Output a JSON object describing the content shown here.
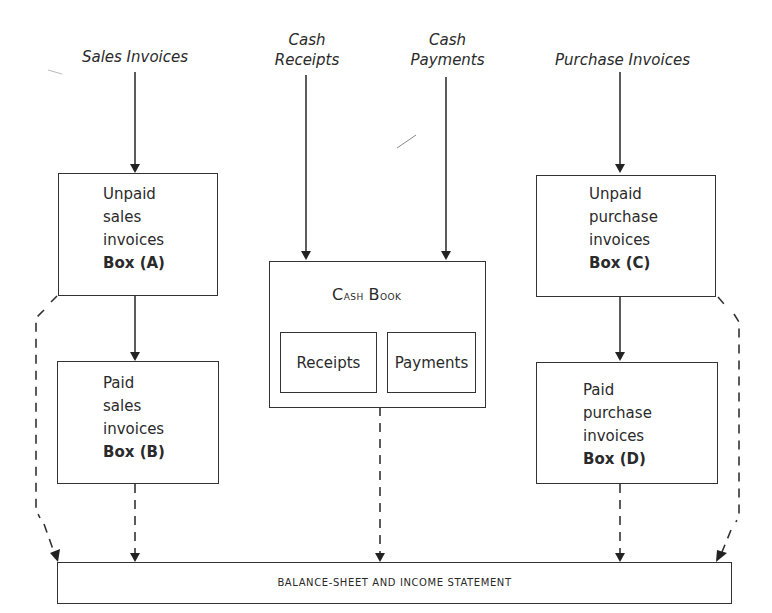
{
  "diagram": {
    "sources": [
      {
        "id": "sales-invoices",
        "label": "Sales Invoices"
      },
      {
        "id": "cash-receipts",
        "label_line1": "Cash",
        "label_line2": "Receipts"
      },
      {
        "id": "cash-payments",
        "label_line1": "Cash",
        "label_line2": "Payments"
      },
      {
        "id": "purchase-invoices",
        "label": "Purchase Invoices"
      }
    ],
    "boxes": {
      "a": {
        "lines": [
          "Unpaid",
          "sales",
          "invoices"
        ],
        "tag": "Box (A)"
      },
      "b": {
        "lines": [
          "Paid",
          "sales",
          "invoices"
        ],
        "tag": "Box (B)"
      },
      "c": {
        "lines": [
          "Unpaid",
          "purchase",
          "invoices"
        ],
        "tag": "Box (C)"
      },
      "d": {
        "lines": [
          "Paid",
          "purchase",
          "invoices"
        ],
        "tag": "Box (D)"
      }
    },
    "cash_book": {
      "title": "Cash Book",
      "title_first_c": "C",
      "title_rest_1": "ash ",
      "title_first_b": "B",
      "title_rest_2": "ook",
      "receipts": "Receipts",
      "payments": "Payments"
    },
    "output": {
      "label": "BALANCE-SHEET AND INCOME STATEMENT"
    },
    "colors": {
      "line": "#333333",
      "text": "#2a2a2a",
      "background": "#ffffff"
    }
  }
}
